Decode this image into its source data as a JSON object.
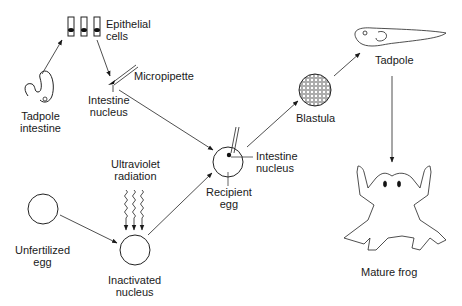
{
  "diagram": {
    "type": "flow",
    "title": "",
    "labels": {
      "epithelial_cells": [
        "Epithelial",
        "cells"
      ],
      "micropipette": "Micropipette",
      "intestine_nucleus_top": [
        "Intestine",
        "nucleus"
      ],
      "tadpole_intestine": [
        "Tadpole",
        "intestine"
      ],
      "ultraviolet_radiation": [
        "Ultraviolet",
        "radiation"
      ],
      "unfertilized_egg": [
        "Unfertilized",
        "egg"
      ],
      "inactivated_nucleus": [
        "Inactivated",
        "nucleus"
      ],
      "recipient_egg": [
        "Recipient",
        "egg"
      ],
      "intestine_nucleus_right": [
        "Intestine",
        "nucleus"
      ],
      "blastula": "Blastula",
      "tadpole": "Tadpole",
      "mature_frog": "Mature frog"
    },
    "nodes": [
      {
        "id": "tadpole_intestine",
        "icon": "intestine-icon"
      },
      {
        "id": "epithelial_cells",
        "icon": "epithelial-cells-icon"
      },
      {
        "id": "micropipette",
        "icon": "micropipette-icon"
      },
      {
        "id": "unfertilized_egg",
        "icon": "egg-icon"
      },
      {
        "id": "uv",
        "icon": "uv-radiation-icon"
      },
      {
        "id": "inactivated_nucleus",
        "icon": "egg-icon"
      },
      {
        "id": "recipient_egg",
        "icon": "egg-with-nucleus-icon"
      },
      {
        "id": "blastula",
        "icon": "blastula-icon"
      },
      {
        "id": "tadpole",
        "icon": "tadpole-icon"
      },
      {
        "id": "mature_frog",
        "icon": "frog-icon"
      }
    ],
    "edges": [
      [
        "tadpole_intestine",
        "epithelial_cells"
      ],
      [
        "epithelial_cells",
        "micropipette"
      ],
      [
        "micropipette",
        "recipient_egg"
      ],
      [
        "unfertilized_egg",
        "inactivated_nucleus"
      ],
      [
        "uv",
        "inactivated_nucleus"
      ],
      [
        "inactivated_nucleus",
        "recipient_egg"
      ],
      [
        "recipient_egg",
        "blastula"
      ],
      [
        "blastula",
        "tadpole"
      ],
      [
        "tadpole",
        "mature_frog"
      ]
    ]
  }
}
